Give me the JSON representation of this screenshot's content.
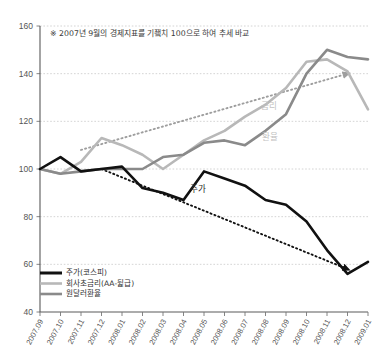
{
  "annotation": {
    "note": "※ 2007년 9월의 경제지표를 기죀치 100으로 하여 추세 바교"
  },
  "inline_labels": {
    "stock": "주가",
    "rate": "금리",
    "fx": "환율"
  },
  "legend": {
    "items": [
      {
        "label": "주가(코스피)",
        "color": "#111111"
      },
      {
        "label": "회사초금리(AA-뒱급)",
        "color": "#b8b8b8"
      },
      {
        "label": "원달러환율",
        "color": "#8a8a8a"
      }
    ]
  },
  "chart_data": {
    "type": "line",
    "title": "",
    "subtitle": "",
    "xlabel": "",
    "ylabel": "",
    "ylim": [
      40,
      160
    ],
    "yticks": [
      40,
      60,
      80,
      100,
      120,
      140,
      160
    ],
    "grid": true,
    "legend_position": "bottom-left",
    "baseline_note": "2007.09 = 100",
    "categories": [
      "2007.09",
      "2007.10",
      "2007.11",
      "2007.12",
      "2008.01",
      "2008.02",
      "2008.03",
      "2008.04",
      "2008.05",
      "2008.06",
      "2008.07",
      "2008.08",
      "2008.09",
      "2008.10",
      "2008.11",
      "2008.12",
      "2009.01"
    ],
    "series": [
      {
        "name": "주가(코스피)",
        "color": "#111111",
        "width": 2.6,
        "values": [
          100,
          105,
          99,
          100,
          101,
          92,
          90,
          87,
          99,
          96,
          93,
          87,
          85,
          78,
          66,
          56,
          61
        ]
      },
      {
        "name": "회사초금리(AA-뒱급)",
        "color": "#b8b8b8",
        "width": 2.6,
        "values": [
          100,
          98,
          103,
          113,
          110,
          106,
          100,
          106,
          112,
          116,
          122,
          127,
          134,
          145,
          146,
          141,
          125
        ]
      },
      {
        "name": "원달러환율",
        "color": "#8a8a8a",
        "width": 2.6,
        "values": [
          100,
          98,
          99,
          100,
          100,
          100,
          105,
          106,
          111,
          112,
          110,
          116,
          123,
          140,
          150,
          147,
          146
        ]
      }
    ],
    "trend_arrows": [
      {
        "name": "rising-trend",
        "color": "#9e9e9e",
        "from": {
          "x": "2007.11",
          "y": 108
        },
        "to": {
          "x": "2008.12",
          "y": 140
        }
      },
      {
        "name": "falling-trend",
        "color": "#111111",
        "from": {
          "x": "2007.12",
          "y": 100
        },
        "to": {
          "x": "2008.12",
          "y": 58
        }
      }
    ]
  }
}
